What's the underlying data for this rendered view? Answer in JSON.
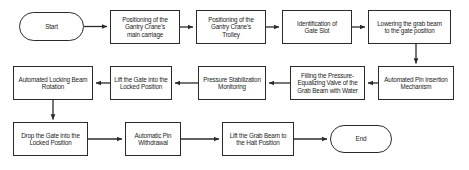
{
  "diagram": {
    "type": "flowchart",
    "orientation": "serpentine-horizontal",
    "colors": {
      "background": "#ffffff",
      "node_stroke": "#2b2b2b",
      "node_fill": "#ffffff",
      "text": "#1b1b1b",
      "connector": "#2b2b2b"
    },
    "rows": [
      {
        "index": 1,
        "direction": "left-to-right",
        "nodes": [
          "start",
          "pos_carriage",
          "pos_trolley",
          "ident_slot",
          "lower_beam"
        ]
      },
      {
        "index": 2,
        "direction": "right-to-left",
        "nodes": [
          "pin_insert",
          "fill_valve",
          "press_mon",
          "lift_gate",
          "lock_rot"
        ]
      },
      {
        "index": 3,
        "direction": "left-to-right",
        "nodes": [
          "drop_gate",
          "pin_withdraw",
          "lift_halt",
          "end"
        ]
      }
    ],
    "nodes": {
      "start": {
        "label": "Start",
        "shape": "terminator"
      },
      "pos_carriage": {
        "label": "Positioning of the\nGantry Crane's\nmain carriage",
        "shape": "process"
      },
      "pos_trolley": {
        "label": "Positioning of the\nGantry Crane's\nTrolley",
        "shape": "process"
      },
      "ident_slot": {
        "label": "Identification of\nGate Slot",
        "shape": "process"
      },
      "lower_beam": {
        "label": "Lowering the grab beam\nto the gate position",
        "shape": "process"
      },
      "pin_insert": {
        "label": "Automated Pin insertion\nMechanism",
        "shape": "process"
      },
      "fill_valve": {
        "label": "Filling the Pressure-\nEqualizing Valve of the\nGrab Beam with Water",
        "shape": "process"
      },
      "press_mon": {
        "label": "Pressure Stabilization\nMonitoring",
        "shape": "process"
      },
      "lift_gate": {
        "label": "Lift the Gate into the\nLocked Position",
        "shape": "process"
      },
      "lock_rot": {
        "label": "Automated Locking Beam\nRotation",
        "shape": "process"
      },
      "drop_gate": {
        "label": "Drop the Gate into the\nLocked Position",
        "shape": "process"
      },
      "pin_withdraw": {
        "label": "Automatic Pin\nWithdrawal",
        "shape": "process"
      },
      "lift_halt": {
        "label": "Lift the Grab Beam to\nthe Halt Position",
        "shape": "process"
      },
      "end": {
        "label": "End",
        "shape": "terminator"
      }
    },
    "connectors": [
      {
        "from": "start",
        "to": "pos_carriage",
        "kind": "horizontal-right"
      },
      {
        "from": "pos_carriage",
        "to": "pos_trolley",
        "kind": "horizontal-right"
      },
      {
        "from": "pos_trolley",
        "to": "ident_slot",
        "kind": "horizontal-right"
      },
      {
        "from": "ident_slot",
        "to": "lower_beam",
        "kind": "horizontal-right"
      },
      {
        "from": "lower_beam",
        "to": "pin_insert",
        "kind": "vertical-down"
      },
      {
        "from": "pin_insert",
        "to": "fill_valve",
        "kind": "horizontal-left"
      },
      {
        "from": "fill_valve",
        "to": "press_mon",
        "kind": "horizontal-left"
      },
      {
        "from": "press_mon",
        "to": "lift_gate",
        "kind": "horizontal-left"
      },
      {
        "from": "lift_gate",
        "to": "lock_rot",
        "kind": "horizontal-left"
      },
      {
        "from": "lock_rot",
        "to": "drop_gate",
        "kind": "vertical-down"
      },
      {
        "from": "drop_gate",
        "to": "pin_withdraw",
        "kind": "horizontal-right"
      },
      {
        "from": "pin_withdraw",
        "to": "lift_halt",
        "kind": "horizontal-right"
      },
      {
        "from": "lift_halt",
        "to": "end",
        "kind": "horizontal-right"
      }
    ]
  }
}
